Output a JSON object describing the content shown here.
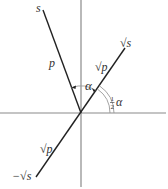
{
  "diagram": {
    "type": "geometric-angle-diagram",
    "origin": {
      "x": 81,
      "y": 113
    },
    "axes": {
      "horizontal": {
        "x1": 0,
        "x2": 166,
        "y": 113,
        "color": "#8a8a8a"
      },
      "vertical": {
        "x": 81,
        "y1": 0,
        "y2": 187,
        "color": "#8a8a8a"
      }
    },
    "lines": [
      {
        "name": "s-ray",
        "x1": 43,
        "y1": 10,
        "x2": 81,
        "y2": 113,
        "color": "#222222"
      },
      {
        "name": "sqrt-s-line",
        "x1": 36,
        "y1": 177,
        "x2": 125,
        "y2": 48,
        "color": "#222222"
      }
    ],
    "labels": {
      "s": "s",
      "p": "p",
      "sqrt_p_upper": "√p",
      "sqrt_s": "√s",
      "alpha": "α",
      "half_alpha_num": "1",
      "half_alpha_den": "2",
      "half_alpha_sym": "α",
      "sqrt_p_lower": "√p",
      "neg_sqrt_s": "−√s"
    },
    "angles": [
      {
        "name": "alpha-arc",
        "label": "α",
        "from": "s-ray",
        "to": "sqrt-s-line"
      },
      {
        "name": "half-alpha-arc",
        "label": "½α",
        "from": "horizontal-axis",
        "to": "sqrt-s-line",
        "double": true
      }
    ]
  }
}
